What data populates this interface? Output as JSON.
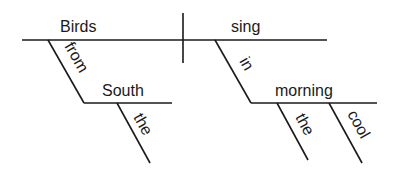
{
  "diagram": {
    "type": "sentence-diagram",
    "words": {
      "subject": "Birds",
      "verb": "sing",
      "subject_preposition": "from",
      "subject_prep_object": "South",
      "subject_prep_object_modifier": "the",
      "verb_preposition": "in",
      "verb_prep_object": "morning",
      "verb_prep_object_modifier_1": "the",
      "verb_prep_object_modifier_2": "cool"
    },
    "colors": {
      "line": "#1a1a1a",
      "text": "#1a1a1a",
      "background": "#ffffff"
    }
  }
}
